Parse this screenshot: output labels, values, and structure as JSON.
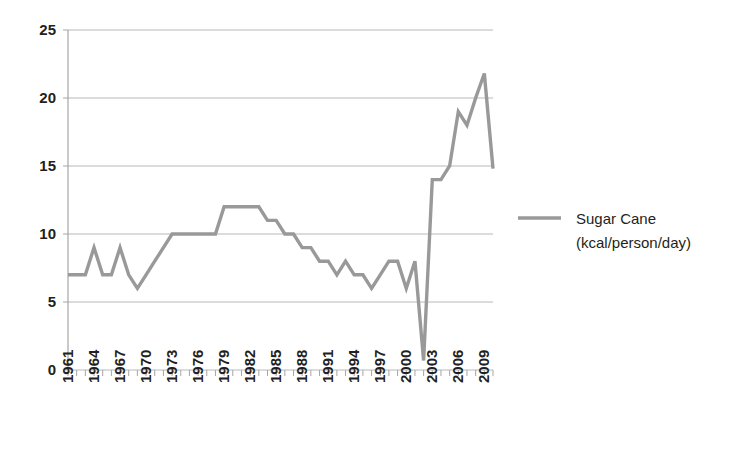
{
  "chart_data": {
    "type": "line",
    "title": "",
    "subtitle": "",
    "xlabel": "",
    "ylabel": "",
    "ylim": [
      0,
      25
    ],
    "y_ticks": [
      0,
      5,
      10,
      15,
      20,
      25
    ],
    "y_tick_labels": [
      "0",
      "5",
      "10",
      "15",
      "20",
      "25"
    ],
    "grid": true,
    "legend_position": "right",
    "legend": [
      "Sugar Cane (kcal/person/day)"
    ],
    "series": [
      {
        "name": "Sugar Cane (kcal/person/day)",
        "color": "#999999",
        "x": [
          1961,
          1962,
          1963,
          1964,
          1965,
          1966,
          1967,
          1968,
          1969,
          1970,
          1971,
          1972,
          1973,
          1974,
          1975,
          1976,
          1977,
          1978,
          1979,
          1980,
          1981,
          1982,
          1983,
          1984,
          1985,
          1986,
          1987,
          1988,
          1989,
          1990,
          1991,
          1992,
          1993,
          1994,
          1995,
          1996,
          1997,
          1998,
          1999,
          2000,
          2001,
          2002,
          2003,
          2004,
          2005,
          2006,
          2007,
          2008,
          2009,
          2010
        ],
        "values": [
          7,
          7,
          7,
          9,
          7,
          7,
          9,
          7,
          6,
          7,
          8,
          9,
          10,
          10,
          10,
          10,
          10,
          10,
          12,
          12,
          12,
          12,
          12,
          11,
          11,
          10,
          10,
          9,
          9,
          8,
          8,
          7,
          8,
          7,
          7,
          6,
          7,
          8,
          8,
          6,
          8,
          0.7,
          14,
          14,
          15,
          19,
          18,
          20,
          21.8,
          14.8
        ]
      }
    ],
    "x_tick_labels": [
      "1961",
      "1964",
      "1967",
      "1970",
      "1973",
      "1976",
      "1979",
      "1982",
      "1985",
      "1988",
      "1991",
      "1994",
      "1997",
      "2000",
      "2003",
      "2006",
      "2009"
    ],
    "x_tick_years": [
      1961,
      1964,
      1967,
      1970,
      1973,
      1976,
      1979,
      1982,
      1985,
      1988,
      1991,
      1994,
      1997,
      2000,
      2003,
      2006,
      2009
    ],
    "x_minor_years": [
      1961,
      1962,
      1963,
      1964,
      1965,
      1966,
      1967,
      1968,
      1969,
      1970,
      1971,
      1972,
      1973,
      1974,
      1975,
      1976,
      1977,
      1978,
      1979,
      1980,
      1981,
      1982,
      1983,
      1984,
      1985,
      1986,
      1987,
      1988,
      1989,
      1990,
      1991,
      1992,
      1993,
      1994,
      1995,
      1996,
      1997,
      1998,
      1999,
      2000,
      2001,
      2002,
      2003,
      2004,
      2005,
      2006,
      2007,
      2008,
      2009,
      2010
    ]
  },
  "legend": {
    "line1": "Sugar Cane",
    "line2": "(kcal/person/day)",
    "swatch_color": "#999999"
  },
  "colors": {
    "series": "#999999",
    "gridline": "#b8b8b8",
    "axis": "#a6a6a6",
    "text": "#231f20",
    "background": "#ffffff"
  }
}
